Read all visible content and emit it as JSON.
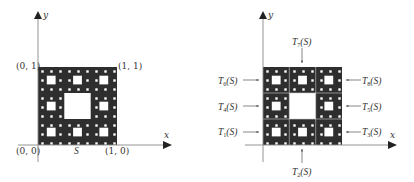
{
  "figure": {
    "left_panel": {
      "axis_labels": {
        "x": "x",
        "y": "y"
      },
      "corner_labels": {
        "top_left": "(0, 1)",
        "top_right": "(1, 1)",
        "bottom_left": "(0, 0)",
        "bottom_right": "(1, 0)"
      },
      "set_label": "S",
      "fractal": "Sierpinski carpet"
    },
    "right_panel": {
      "axis_labels": {
        "x": "x",
        "y": "y"
      },
      "maps": [
        {
          "name": "T",
          "index": "1",
          "arg": "(S)",
          "side": "left",
          "row": "bottom"
        },
        {
          "name": "T",
          "index": "2",
          "arg": "(S)",
          "side": "bottom",
          "col": "middle"
        },
        {
          "name": "T",
          "index": "3",
          "arg": "(S)",
          "side": "right",
          "row": "bottom"
        },
        {
          "name": "T",
          "index": "4",
          "arg": "(S)",
          "side": "left",
          "row": "middle"
        },
        {
          "name": "T",
          "index": "5",
          "arg": "(S)",
          "side": "right",
          "row": "middle"
        },
        {
          "name": "T",
          "index": "6",
          "arg": "(S)",
          "side": "left",
          "row": "top"
        },
        {
          "name": "T",
          "index": "7",
          "arg": "(S)",
          "side": "top",
          "col": "middle"
        },
        {
          "name": "T",
          "index": "8",
          "arg": "(S)",
          "side": "right",
          "row": "top"
        }
      ]
    },
    "colors": {
      "fill": "#2e2e2e",
      "hole": "#ffffff",
      "axis": "#888888",
      "text": "#333333"
    }
  }
}
